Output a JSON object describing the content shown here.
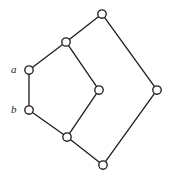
{
  "figure": {
    "kind": "undirected-graph-diagram",
    "background_color": "#ffffff",
    "stroke_color": "#231f20",
    "node_fill_color": "#ffffff",
    "node_radius": 4.2,
    "edge_width": 1.35,
    "width": 170,
    "height": 181
  },
  "chart_data": {
    "type": "diagram",
    "title": "",
    "xlabel": "",
    "ylabel": "",
    "nodes": [
      {
        "id": "n1",
        "label": "",
        "x": 102,
        "y": 14
      },
      {
        "id": "n2",
        "label": "",
        "x": 66,
        "y": 42
      },
      {
        "id": "n3",
        "label": "a",
        "x": 29,
        "y": 70
      },
      {
        "id": "n4",
        "label": "",
        "x": 99,
        "y": 90
      },
      {
        "id": "n5",
        "label": "",
        "x": 157,
        "y": 90
      },
      {
        "id": "n6",
        "label": "b",
        "x": 29,
        "y": 110
      },
      {
        "id": "n7",
        "label": "",
        "x": 67,
        "y": 137
      },
      {
        "id": "n8",
        "label": "",
        "x": 103,
        "y": 165
      }
    ],
    "edges": [
      {
        "from": "n1",
        "to": "n2"
      },
      {
        "from": "n1",
        "to": "n5"
      },
      {
        "from": "n2",
        "to": "n3"
      },
      {
        "from": "n2",
        "to": "n4"
      },
      {
        "from": "n3",
        "to": "n6"
      },
      {
        "from": "n4",
        "to": "n7"
      },
      {
        "from": "n5",
        "to": "n8"
      },
      {
        "from": "n6",
        "to": "n7"
      },
      {
        "from": "n7",
        "to": "n8"
      }
    ]
  },
  "labels": [
    {
      "name": "vertex-label-a",
      "text": "a",
      "x": 11,
      "y": 64
    },
    {
      "name": "vertex-label-b",
      "text": "b",
      "x": 11,
      "y": 104
    }
  ]
}
